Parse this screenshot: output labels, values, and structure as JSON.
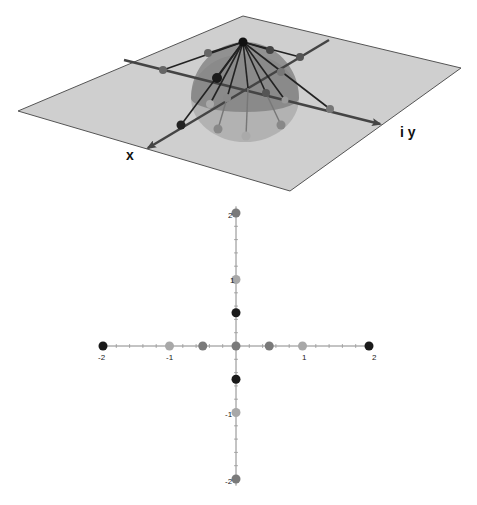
{
  "scene3d": {
    "plane_color": "#cfcfcf",
    "plane_edge_color": "#555555",
    "axis_color": "#444444",
    "sphere_color": "#8a8a8a",
    "x_axis_label": "x",
    "y_axis_label": "i y",
    "plane_corners": [
      [
        243,
        16
      ],
      [
        461,
        68
      ],
      [
        290,
        191
      ],
      [
        18,
        111
      ]
    ],
    "north_pole": [
      243,
      42
    ]
  },
  "plot2d": {
    "origin_px": [
      236,
      346
    ],
    "unit_px": 66.5,
    "axis_color": "#888888",
    "x_tick_labels": [
      "-2",
      "-1",
      "1",
      "2"
    ],
    "y_tick_labels": [
      "2",
      "1",
      "-1",
      "-2"
    ]
  },
  "colors": {
    "black": "#1a1a1a",
    "dark_gray": "#5a5a5a",
    "mid_gray": "#7a7a7a",
    "light_gray": "#a8a8a8"
  },
  "chart_data": {
    "type": "scatter",
    "title": "",
    "xlabel": "",
    "ylabel": "",
    "xlim": [
      -2,
      2
    ],
    "ylim": [
      -2,
      2
    ],
    "grid": false,
    "x_ticks": [
      -2,
      -1,
      1,
      2
    ],
    "y_ticks": [
      -2,
      -1,
      1,
      2
    ],
    "minor_tick_step": 0.2,
    "points": [
      {
        "x": -2,
        "y": 0,
        "color": "black"
      },
      {
        "x": -1,
        "y": 0,
        "color": "light_gray"
      },
      {
        "x": -0.5,
        "y": 0,
        "color": "mid_gray"
      },
      {
        "x": 0,
        "y": 0,
        "color": "mid_gray"
      },
      {
        "x": 0.5,
        "y": 0,
        "color": "mid_gray"
      },
      {
        "x": 1,
        "y": 0,
        "color": "light_gray"
      },
      {
        "x": 2,
        "y": 0,
        "color": "black"
      },
      {
        "x": 0,
        "y": 2,
        "color": "mid_gray"
      },
      {
        "x": 0,
        "y": 1,
        "color": "light_gray"
      },
      {
        "x": 0,
        "y": 0.5,
        "color": "black"
      },
      {
        "x": 0,
        "y": -0.5,
        "color": "black"
      },
      {
        "x": 0,
        "y": -1,
        "color": "light_gray"
      },
      {
        "x": 0,
        "y": -2,
        "color": "mid_gray"
      }
    ]
  }
}
